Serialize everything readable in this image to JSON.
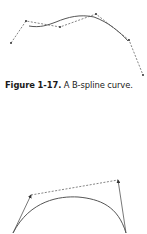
{
  "figure1": {
    "caption_label": "Figure 1-17.",
    "caption_text": " A B-spline curve.",
    "control_points": [
      [
        11,
        43
      ],
      [
        26,
        21
      ],
      [
        60,
        27
      ],
      [
        96,
        14
      ],
      [
        129,
        40
      ],
      [
        143,
        75
      ]
    ],
    "curve_path": "M29,26 C40,28 48,25 56,22 C68,17 80,14 94,17 C108,22 120,32 128,41"
  },
  "figure2": {
    "start_point": [
      13,
      233
    ],
    "end_point": [
      126,
      233
    ],
    "start_tangent_tip": [
      31,
      195
    ],
    "end_tangent_tip": [
      118,
      180
    ],
    "curve_path": "M13,233 C30,200 60,196 78,197 C100,199 118,206 126,233"
  },
  "colors": {
    "curve": "#555555",
    "control_polygon": "#666666",
    "points": "#333333"
  }
}
